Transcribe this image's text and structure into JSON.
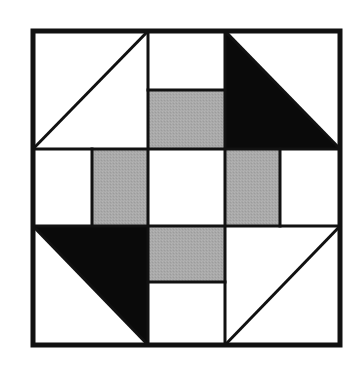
{
  "diagram": {
    "colors": {
      "background": "#ffffff",
      "line": "#111111",
      "dark": "#0a0a0a",
      "gray": "#a9a9a9",
      "light": "#ffffff"
    },
    "outer": {
      "x": 33,
      "y": 31,
      "w": 307,
      "h": 314,
      "stroke": 5
    },
    "grid": {
      "cols": [
        33,
        148,
        225,
        340
      ],
      "rows": [
        31,
        149,
        226,
        345
      ],
      "stroke": 3
    },
    "cells": [
      {
        "name": "top-left-hst",
        "type": "half-square",
        "dark_half": "none",
        "diagonal": "bl-tr",
        "row": 0,
        "col": 0
      },
      {
        "name": "top-center",
        "type": "split-h",
        "top": "light",
        "bottom": "gray",
        "split_y": 90,
        "row": 0,
        "col": 1
      },
      {
        "name": "top-right-hst",
        "type": "half-square",
        "dark_half": "bottom-left",
        "diagonal": "tl-br",
        "row": 0,
        "col": 2
      },
      {
        "name": "middle-left",
        "type": "split-v",
        "left": "light",
        "right": "gray",
        "split_x": 92,
        "row": 1,
        "col": 0
      },
      {
        "name": "center",
        "type": "solid",
        "fill": "light",
        "row": 1,
        "col": 1
      },
      {
        "name": "middle-right",
        "type": "split-v",
        "left": "gray",
        "right": "light",
        "split_x": 280,
        "row": 1,
        "col": 2
      },
      {
        "name": "bottom-left-hst",
        "type": "half-square",
        "dark_half": "top-right",
        "diagonal": "tl-br",
        "row": 2,
        "col": 0
      },
      {
        "name": "bottom-center",
        "type": "split-h",
        "top": "gray",
        "bottom": "light",
        "split_y": 282,
        "row": 2,
        "col": 1
      },
      {
        "name": "bottom-right-hst",
        "type": "half-square",
        "dark_half": "none",
        "diagonal": "bl-tr",
        "row": 2,
        "col": 2
      }
    ]
  }
}
